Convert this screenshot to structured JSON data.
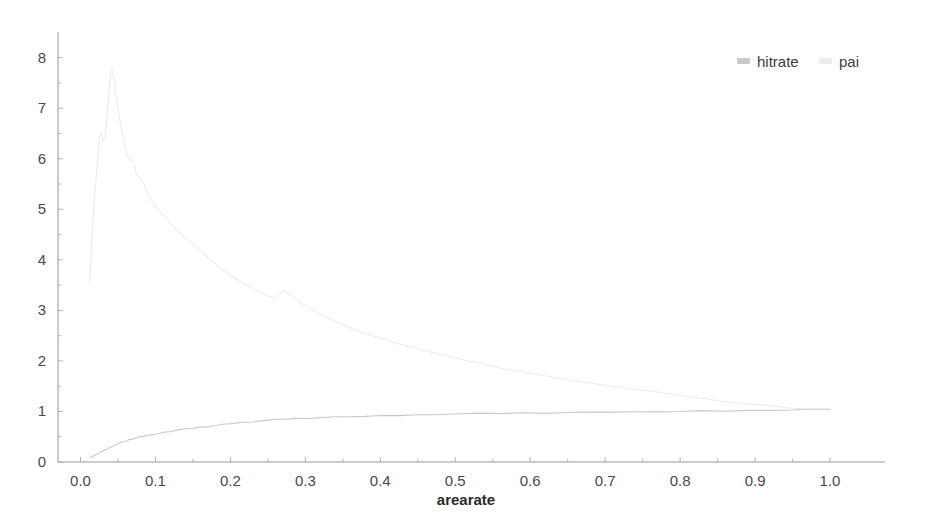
{
  "chart_data": {
    "type": "line",
    "title": "",
    "xlabel": "arearate",
    "ylabel": "",
    "xlim": [
      -0.03,
      1.06
    ],
    "ylim": [
      0,
      8.35
    ],
    "grid": false,
    "legend_position": "top-right",
    "xticks": [
      "0.0",
      "0.1",
      "0.2",
      "0.3",
      "0.4",
      "0.5",
      "0.6",
      "0.7",
      "0.8",
      "0.9",
      "1.0"
    ],
    "xtick_values": [
      0.0,
      0.1,
      0.2,
      0.3,
      0.4,
      0.5,
      0.6,
      0.7,
      0.8,
      0.9,
      1.0
    ],
    "yticks": [
      "0",
      "1",
      "2",
      "3",
      "4",
      "5",
      "6",
      "7",
      "8"
    ],
    "ytick_values": [
      0,
      1,
      2,
      3,
      4,
      5,
      6,
      7,
      8
    ],
    "colors": {
      "hitrate": "#c9c9c9",
      "pai": "#ebebeb",
      "axis": "#9a9a9a",
      "text": "#4a4a4a"
    },
    "series": [
      {
        "name": "hitrate",
        "color": "#c9c9c9",
        "x": [
          0.012,
          0.016,
          0.02,
          0.024,
          0.028,
          0.032,
          0.036,
          0.04,
          0.045,
          0.05,
          0.055,
          0.06,
          0.065,
          0.07,
          0.075,
          0.08,
          0.085,
          0.09,
          0.095,
          0.1,
          0.11,
          0.12,
          0.13,
          0.14,
          0.15,
          0.16,
          0.17,
          0.18,
          0.19,
          0.2,
          0.215,
          0.23,
          0.245,
          0.26,
          0.275,
          0.29,
          0.305,
          0.32,
          0.34,
          0.36,
          0.38,
          0.4,
          0.425,
          0.45,
          0.475,
          0.5,
          0.53,
          0.56,
          0.59,
          0.62,
          0.65,
          0.68,
          0.71,
          0.74,
          0.77,
          0.8,
          0.83,
          0.86,
          0.89,
          0.92,
          0.95,
          0.975,
          1.0
        ],
        "y": [
          0.08,
          0.11,
          0.14,
          0.17,
          0.2,
          0.23,
          0.26,
          0.29,
          0.33,
          0.36,
          0.39,
          0.41,
          0.44,
          0.46,
          0.48,
          0.5,
          0.51,
          0.53,
          0.54,
          0.55,
          0.58,
          0.61,
          0.63,
          0.65,
          0.67,
          0.69,
          0.7,
          0.72,
          0.74,
          0.76,
          0.78,
          0.8,
          0.82,
          0.84,
          0.85,
          0.86,
          0.87,
          0.88,
          0.89,
          0.9,
          0.9,
          0.91,
          0.92,
          0.93,
          0.94,
          0.95,
          0.96,
          0.96,
          0.97,
          0.97,
          0.98,
          0.98,
          0.99,
          0.99,
          1.0,
          1.0,
          1.01,
          1.01,
          1.02,
          1.03,
          1.03,
          1.04,
          1.05
        ]
      },
      {
        "name": "pai",
        "color": "#ebebeb",
        "x": [
          0.012,
          0.014,
          0.016,
          0.018,
          0.02,
          0.022,
          0.024,
          0.026,
          0.028,
          0.03,
          0.032,
          0.034,
          0.036,
          0.038,
          0.04,
          0.042,
          0.044,
          0.046,
          0.048,
          0.05,
          0.053,
          0.056,
          0.059,
          0.062,
          0.065,
          0.068,
          0.071,
          0.074,
          0.078,
          0.082,
          0.086,
          0.09,
          0.095,
          0.1,
          0.107,
          0.114,
          0.121,
          0.128,
          0.136,
          0.144,
          0.152,
          0.16,
          0.17,
          0.18,
          0.19,
          0.2,
          0.212,
          0.224,
          0.236,
          0.248,
          0.258,
          0.266,
          0.272,
          0.28,
          0.292,
          0.305,
          0.32,
          0.335,
          0.35,
          0.37,
          0.39,
          0.41,
          0.43,
          0.455,
          0.48,
          0.505,
          0.53,
          0.56,
          0.59,
          0.62,
          0.65,
          0.68,
          0.71,
          0.74,
          0.77,
          0.8,
          0.83,
          0.86,
          0.89,
          0.92,
          0.95,
          0.975,
          1.0
        ],
        "y": [
          3.55,
          4.05,
          4.55,
          5.05,
          5.45,
          5.85,
          6.2,
          6.45,
          6.52,
          6.35,
          6.4,
          6.62,
          6.95,
          7.35,
          7.62,
          7.75,
          7.66,
          7.45,
          7.2,
          6.98,
          6.72,
          6.48,
          6.28,
          6.1,
          5.95,
          6.0,
          5.92,
          5.72,
          5.62,
          5.58,
          5.45,
          5.3,
          5.18,
          5.05,
          4.92,
          4.85,
          4.72,
          4.6,
          4.48,
          4.38,
          4.28,
          4.18,
          4.05,
          3.92,
          3.8,
          3.7,
          3.58,
          3.48,
          3.38,
          3.3,
          3.25,
          3.32,
          3.4,
          3.3,
          3.18,
          3.05,
          2.92,
          2.82,
          2.72,
          2.6,
          2.5,
          2.4,
          2.32,
          2.22,
          2.12,
          2.04,
          1.96,
          1.86,
          1.78,
          1.7,
          1.63,
          1.56,
          1.5,
          1.44,
          1.38,
          1.32,
          1.26,
          1.2,
          1.15,
          1.11,
          1.07,
          1.05,
          1.05
        ]
      }
    ]
  },
  "legend": {
    "items": [
      {
        "label": "hitrate",
        "color": "#c9c9c9"
      },
      {
        "label": "pai",
        "color": "#ebebeb"
      }
    ]
  },
  "axes": {
    "x_title": "arearate"
  }
}
